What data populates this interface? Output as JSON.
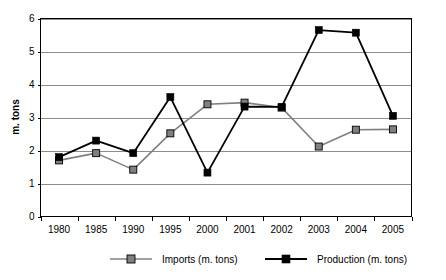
{
  "chart_data": {
    "type": "line",
    "title": "",
    "subtitle": "",
    "xlabel": "",
    "ylabel": "m. tons",
    "categories": [
      "1980",
      "1985",
      "1990",
      "1995",
      "2000",
      "2001",
      "2002",
      "2003",
      "2004",
      "2005"
    ],
    "ylim": [
      0,
      6
    ],
    "yticks": [
      "0",
      "1",
      "2",
      "3",
      "4",
      "5",
      "6"
    ],
    "ytick_values": [
      0,
      1,
      2,
      3,
      4,
      5,
      6
    ],
    "grid": "horizontal",
    "legend_position": "bottom",
    "series": [
      {
        "name": "Imports (m. tons)",
        "color": "#808080",
        "marker": "square",
        "values": [
          1.7,
          1.92,
          1.42,
          2.52,
          3.4,
          3.45,
          3.3,
          2.12,
          2.63,
          2.64
        ]
      },
      {
        "name": "Production (m. tons)",
        "color": "#000000",
        "marker": "square",
        "values": [
          1.8,
          2.3,
          1.92,
          3.62,
          1.33,
          3.33,
          3.32,
          5.65,
          5.57,
          3.05
        ]
      }
    ],
    "annotations": []
  },
  "axes": {
    "y_axis_title": "m. tons",
    "y_tick_labels": [
      "6",
      "5",
      "4",
      "3",
      "2",
      "1",
      "0"
    ],
    "x_tick_labels": [
      "1980",
      "1985",
      "1990",
      "1995",
      "2000",
      "2001",
      "2002",
      "2003",
      "2004",
      "2005"
    ]
  },
  "legend": {
    "items": [
      {
        "label": "Imports (m. tons)",
        "color": "#808080"
      },
      {
        "label": "Production (m. tons)",
        "color": "#000000"
      }
    ]
  },
  "colors": {
    "imports": "#808080",
    "production": "#000000",
    "gridline": "#8c8c8c",
    "axis": "#000000",
    "background": "#ffffff"
  }
}
